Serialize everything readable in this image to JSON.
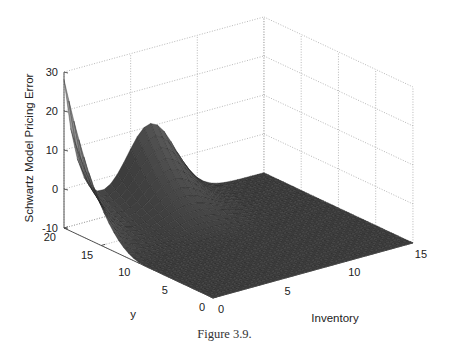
{
  "figure": {
    "caption": "Figure 3.9."
  },
  "chart_data": {
    "type": "surface",
    "title": "",
    "xlabel": "Inventory",
    "ylabel": "y",
    "zlabel": "Schwartz Model Pricing Error",
    "xlim": [
      0,
      15
    ],
    "ylim": [
      0,
      20
    ],
    "zlim": [
      -10,
      30
    ],
    "x_ticks": [
      0,
      5,
      10,
      15
    ],
    "y_ticks": [
      0,
      5,
      10,
      15,
      20
    ],
    "z_ticks": [
      -10,
      0,
      10,
      20,
      30
    ],
    "grid": true,
    "colormap": "gray",
    "sample_points": [
      {
        "inventory": 0,
        "y": 20,
        "z": 25
      },
      {
        "inventory": 0,
        "y": 17,
        "z": 10
      },
      {
        "inventory": 0,
        "y": 14,
        "z": -3
      },
      {
        "inventory": 0,
        "y": 10,
        "z": -10
      },
      {
        "inventory": 0,
        "y": 0,
        "z": -10
      },
      {
        "inventory": 3,
        "y": 20,
        "z": 0
      },
      {
        "inventory": 6,
        "y": 20,
        "z": 10
      },
      {
        "inventory": 9,
        "y": 20,
        "z": 3
      },
      {
        "inventory": 15,
        "y": 20,
        "z": -10
      },
      {
        "inventory": 15,
        "y": 0,
        "z": -10
      }
    ]
  }
}
